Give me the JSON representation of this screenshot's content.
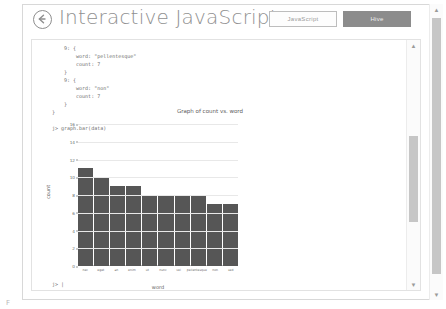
{
  "header": {
    "back_icon": "back-arrow-icon",
    "title": "Interactive JavaScript",
    "toggles": [
      {
        "label": "JavaScript",
        "state": "inactive"
      },
      {
        "label": "Hive",
        "state": "active"
      }
    ]
  },
  "console": {
    "code": "    9: {\n        word: \"pellentesque\"\n        count: 7\n    }\n    9: {\n        word: \"non\"\n        count: 7\n    }\n}\n\nj> graph.bar(data)",
    "tail_prompt": "j> |"
  },
  "scrollbars": {
    "up_arrow": "▲",
    "down_arrow": "▼"
  },
  "corner": {
    "label": "F"
  },
  "chart_data": {
    "type": "bar",
    "title": "Graph of count vs. word",
    "xlabel": "word",
    "ylabel": "count",
    "ylim": [
      0,
      16
    ],
    "yticks": [
      16,
      14,
      12,
      10,
      8,
      6,
      4,
      2,
      0
    ],
    "grid": true,
    "legend": "none",
    "categories": [
      "nec",
      "eget",
      "an",
      "enim",
      "ut",
      "nunc",
      "vel",
      "pellentesque",
      "non",
      "sed"
    ],
    "values": [
      11,
      10,
      9,
      9,
      8,
      8,
      8,
      8,
      7,
      7
    ]
  }
}
